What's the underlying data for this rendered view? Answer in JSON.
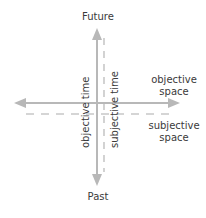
{
  "diagram": {
    "top_label": "Future",
    "bottom_label": "Past",
    "vertical_left_label": "objective time",
    "vertical_right_label": "subjective time",
    "right_upper_label_line1": "objective",
    "right_upper_label_line2": "space",
    "right_lower_label_line1": "subjective",
    "right_lower_label_line2": "space",
    "colors": {
      "axis": "#b8b8b8",
      "dashed": "#c8c8c8",
      "text": "#3a3a3a"
    }
  }
}
